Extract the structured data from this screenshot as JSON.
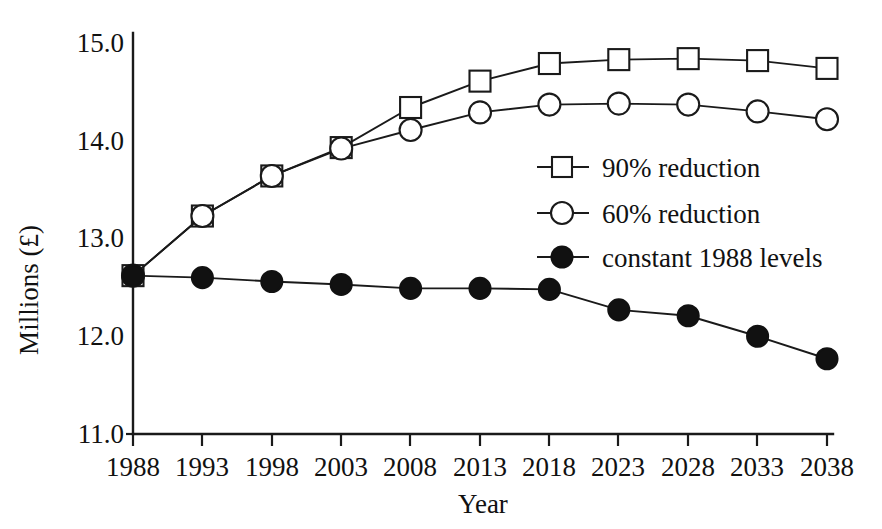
{
  "chart_data": {
    "type": "line",
    "title": "",
    "xlabel": "Year",
    "ylabel": "Millions (£)",
    "x": [
      1988,
      1993,
      1998,
      2003,
      2008,
      2013,
      2018,
      2023,
      2028,
      2033,
      2038
    ],
    "xticklabels": [
      "1988",
      "1993",
      "1998",
      "2003",
      "2008",
      "2013",
      "2018",
      "2023",
      "2028",
      "2033",
      "2038"
    ],
    "yticklabels": [
      "11.0",
      "12.0",
      "13.0",
      "14.0",
      "15.0"
    ],
    "yticks": [
      11.0,
      12.0,
      13.0,
      14.0,
      15.0
    ],
    "xlim": [
      1988,
      2038
    ],
    "ylim": [
      11.0,
      15.0
    ],
    "grid": false,
    "legend_position": "center-right",
    "series": [
      {
        "name": "90% reduction",
        "marker": "open-square",
        "color": "#111111",
        "values": [
          12.62,
          13.23,
          13.64,
          13.93,
          14.34,
          14.61,
          14.79,
          14.83,
          14.84,
          14.82,
          14.74
        ]
      },
      {
        "name": "60% reduction",
        "marker": "open-circle",
        "color": "#111111",
        "values": [
          12.62,
          13.23,
          13.64,
          13.92,
          14.11,
          14.29,
          14.37,
          14.38,
          14.37,
          14.3,
          14.22
        ]
      },
      {
        "name": "constant 1988 levels",
        "marker": "filled-circle",
        "color": "#111111",
        "values": [
          12.62,
          12.6,
          12.56,
          12.53,
          12.49,
          12.49,
          12.48,
          12.27,
          12.21,
          12.0,
          11.77
        ]
      }
    ]
  },
  "legend": {
    "entries": [
      {
        "label": "90% reduction",
        "marker": "open-square"
      },
      {
        "label": "60% reduction",
        "marker": "open-circle"
      },
      {
        "label": "constant 1988 levels",
        "marker": "filled-circle"
      }
    ]
  },
  "axes": {
    "y_title": "Millions (£)",
    "x_title": "Year"
  }
}
